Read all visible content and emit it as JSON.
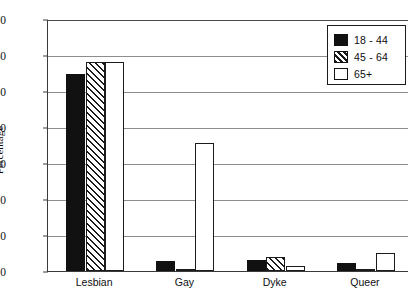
{
  "chart_data": {
    "type": "bar",
    "title": "",
    "subtitle": "",
    "xlabel": "",
    "ylabel": "Percentage",
    "ylim": [
      0,
      70
    ],
    "ytick_step": 10,
    "yticks": [
      0,
      10,
      20,
      30,
      40,
      50,
      60,
      70
    ],
    "ytick_labels": [
      "0",
      "10",
      "20",
      "30",
      "40",
      "50",
      "60",
      "70"
    ],
    "grid": "horizontal",
    "legend_position": "top-right",
    "categories": [
      "Lesbian",
      "Gay",
      "Dyke",
      "Queer"
    ],
    "series": [
      {
        "name": "18 - 44",
        "fill": "solid-black",
        "color": "#111111",
        "values": [
          54.7,
          2.7,
          3.0,
          2.2
        ]
      },
      {
        "name": "45 - 64",
        "fill": "diagonal-hatch",
        "color": "#ffffff",
        "values": [
          58.0,
          0.3,
          4.0,
          0.3
        ]
      },
      {
        "name": "65+",
        "fill": "white-outline",
        "color": "#ffffff",
        "values": [
          58.0,
          35.6,
          1.5,
          5.0
        ]
      }
    ]
  },
  "legend": {
    "entries": [
      {
        "label": "18 - 44"
      },
      {
        "label": "45 - 64"
      },
      {
        "label": "65+"
      }
    ]
  }
}
